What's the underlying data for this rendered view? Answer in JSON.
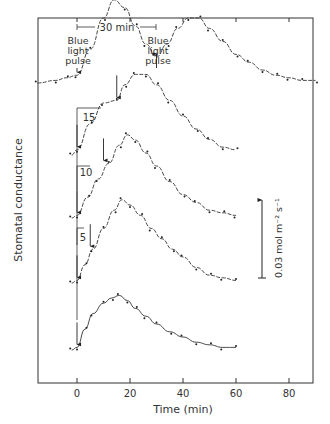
{
  "chart_data": {
    "type": "line",
    "title": "",
    "xlabel": "Time (min)",
    "ylabel": "Stomatal conductance",
    "xlim": [
      -15,
      90
    ],
    "x_ticks": [
      0,
      20,
      40,
      60,
      80
    ],
    "x_tick_labels": [
      "0",
      "20",
      "40",
      "60",
      "80"
    ],
    "grid": false,
    "scale_bar": {
      "label": "0.03 mol m⁻² s⁻¹",
      "value": 0.03,
      "units": "mol m-2 s-1"
    },
    "annotations": [
      {
        "text": "30 min",
        "type": "bracket",
        "from_x": 0,
        "to_x": 30
      },
      {
        "text": "Blue light pulse",
        "x": 0,
        "trace": 1
      },
      {
        "text": "Blue light pulse",
        "x": 30,
        "trace": 1
      },
      {
        "text": "15",
        "type": "interval",
        "from_x": 0,
        "to_x": 15,
        "trace": 2
      },
      {
        "text": "10",
        "type": "interval",
        "from_x": 0,
        "to_x": 10,
        "trace": 3
      },
      {
        "text": "5",
        "type": "interval",
        "from_x": 0,
        "to_x": 5,
        "trace": 4
      }
    ],
    "series": [
      {
        "name": "Two pulses 30 min apart",
        "pulses_at": [
          0,
          30
        ],
        "baseline_px": 50,
        "x": [
          -15,
          -8,
          -4,
          0,
          5,
          10,
          14,
          18,
          22,
          26,
          30,
          34,
          38,
          42,
          46,
          50,
          55,
          60,
          65,
          70,
          75,
          80,
          85,
          90
        ],
        "y": [
          0.0,
          0.001,
          0.002,
          0.003,
          0.013,
          0.025,
          0.032,
          0.029,
          0.022,
          0.015,
          0.01,
          0.015,
          0.021,
          0.025,
          0.025,
          0.021,
          0.016,
          0.011,
          0.008,
          0.005,
          0.003,
          0.002,
          0.001,
          0.001
        ]
      },
      {
        "name": "Two pulses 15 min apart",
        "pulses_at": [
          0,
          15
        ],
        "x": [
          -2,
          0,
          5,
          10,
          15,
          18,
          22,
          26,
          30,
          35,
          40,
          45,
          50,
          55,
          60
        ],
        "y": [
          0.0,
          0.002,
          0.012,
          0.02,
          0.021,
          0.027,
          0.031,
          0.031,
          0.027,
          0.021,
          0.015,
          0.01,
          0.006,
          0.003,
          0.002
        ]
      },
      {
        "name": "Two pulses 10 min apart",
        "pulses_at": [
          0,
          10
        ],
        "x": [
          -2,
          0,
          4,
          8,
          12,
          16,
          19,
          22,
          26,
          30,
          35,
          40,
          45,
          50,
          55,
          60
        ],
        "y": [
          0.0,
          0.001,
          0.008,
          0.015,
          0.021,
          0.028,
          0.032,
          0.03,
          0.025,
          0.02,
          0.014,
          0.009,
          0.006,
          0.003,
          0.002,
          0.001
        ]
      },
      {
        "name": "Two pulses 5 min apart",
        "pulses_at": [
          0,
          5
        ],
        "x": [
          -2,
          0,
          3,
          6,
          10,
          14,
          17,
          20,
          24,
          28,
          32,
          36,
          40,
          45,
          50,
          55,
          60
        ],
        "y": [
          0.0,
          0.001,
          0.007,
          0.013,
          0.021,
          0.028,
          0.032,
          0.03,
          0.026,
          0.021,
          0.017,
          0.013,
          0.01,
          0.006,
          0.003,
          0.002,
          0.001
        ]
      },
      {
        "name": "Single pulse",
        "pulses_at": [
          0
        ],
        "x": [
          -2,
          0,
          3,
          6,
          10,
          13,
          16,
          19,
          22,
          26,
          30,
          35,
          40,
          45,
          50,
          55,
          60
        ],
        "y": [
          0.0,
          0.001,
          0.008,
          0.014,
          0.018,
          0.02,
          0.021,
          0.019,
          0.016,
          0.013,
          0.01,
          0.007,
          0.005,
          0.003,
          0.002,
          0.001,
          0.001
        ]
      }
    ]
  },
  "labels": {
    "xlabel": "Time (min)",
    "ylabel": "Stomatal conductance",
    "bracket": "30 min",
    "pulse_label_line1": "Blue",
    "pulse_label_line2": "light",
    "pulse_label_line3": "pulse",
    "interval_15": "15",
    "interval_10": "10",
    "interval_5": "5",
    "scale_bar": "0.03 mol m⁻² s⁻¹"
  }
}
